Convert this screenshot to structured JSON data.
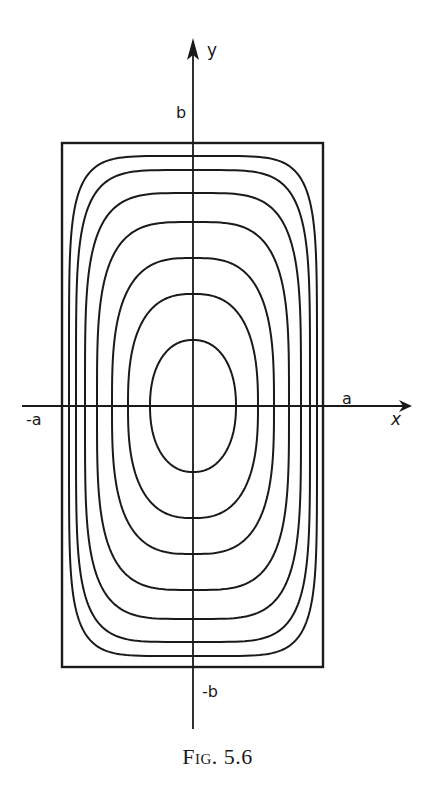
{
  "figure": {
    "caption": "Fig. 5.6",
    "axes": {
      "x_label": "x",
      "y_label": "y",
      "x_pos_tick": "a",
      "x_neg_tick": "-a",
      "y_pos_tick": "b",
      "y_neg_tick": "-b"
    },
    "geometry": {
      "origin": [
        193,
        406
      ],
      "rectangle": {
        "left": 62,
        "top": 143,
        "right": 323,
        "bottom": 667
      },
      "x_axis": {
        "from": 22,
        "to": 412
      },
      "y_axis": {
        "from": 729,
        "to": 38
      }
    },
    "contours": [
      {
        "hw": 124,
        "hh": 250,
        "n": 6.0
      },
      {
        "hw": 117,
        "hh": 236,
        "n": 5.0
      },
      {
        "hw": 108,
        "hh": 213,
        "n": 4.2
      },
      {
        "hw": 96,
        "hh": 184,
        "n": 3.6
      },
      {
        "hw": 81,
        "hh": 148,
        "n": 3.0
      },
      {
        "hw": 65,
        "hh": 112,
        "n": 2.6
      },
      {
        "hw": 43,
        "hh": 66,
        "n": 2.2
      }
    ],
    "colors": {
      "ink": "#1a1a1a",
      "paper": "#ffffff"
    }
  }
}
